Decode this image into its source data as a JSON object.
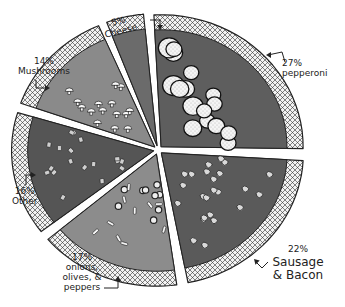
{
  "chart_data": {
    "type": "pie",
    "title": "",
    "style": "hand-drawn pizza",
    "slices": [
      {
        "label": "Cheese",
        "value": 5,
        "pct_label": "5%",
        "color": "#6b6b6b",
        "topping": "none"
      },
      {
        "label": "pepperoni",
        "value": 27,
        "pct_label": "27%",
        "color": "#5e5e5e",
        "topping": "pepperoni"
      },
      {
        "label": "Sausage & Bacon",
        "value": 22,
        "pct_label": "22%",
        "color": "#5a5a5a",
        "topping": "sausage"
      },
      {
        "label": "onions, olives, & peppers",
        "value": 17,
        "pct_label": "17%",
        "color": "#8c8c8c",
        "topping": "veggies"
      },
      {
        "label": "Other",
        "value": 16,
        "pct_label": "16%",
        "color": "#555555",
        "topping": "other"
      },
      {
        "label": "Mushrooms",
        "value": 14,
        "pct_label": "14%",
        "color": "#8a8a8a",
        "topping": "mushrooms"
      }
    ],
    "legend": "none",
    "crust_color": "#e8e8e8",
    "outline_color": "#222222"
  }
}
